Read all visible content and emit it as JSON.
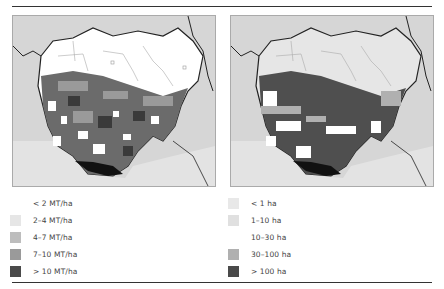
{
  "maps": {
    "left": {
      "subject": "yield map",
      "legend": [
        {
          "label": "< 2 MT/ha",
          "color": "#ffffff"
        },
        {
          "label": "2–4 MT/ha",
          "color": "#e6e6e6"
        },
        {
          "label": "4–7 MT/ha",
          "color": "#bdbdbd"
        },
        {
          "label": "7–10 MT/ha",
          "color": "#9a9a9a"
        },
        {
          "label": "> 10 MT/ha",
          "color": "#4a4a4a"
        }
      ]
    },
    "right": {
      "subject": "farm size map",
      "legend": [
        {
          "label": "< 1 ha",
          "color": "#e8e8e8"
        },
        {
          "label": "1–10 ha",
          "color": "#e0e0e0"
        },
        {
          "label": "10–30 ha",
          "color": "#ffffff"
        },
        {
          "label": "30–100 ha",
          "color": "#b0b0b0"
        },
        {
          "label": "> 100 ha",
          "color": "#4a4a4a"
        }
      ]
    }
  },
  "colors": {
    "background_land": "#d4d4d4",
    "ocean": "#e2e2e2",
    "north_fill_left": "#ffffff",
    "north_fill_right": "#e6e6e6",
    "dense": "#555555",
    "coast": "#111111"
  }
}
